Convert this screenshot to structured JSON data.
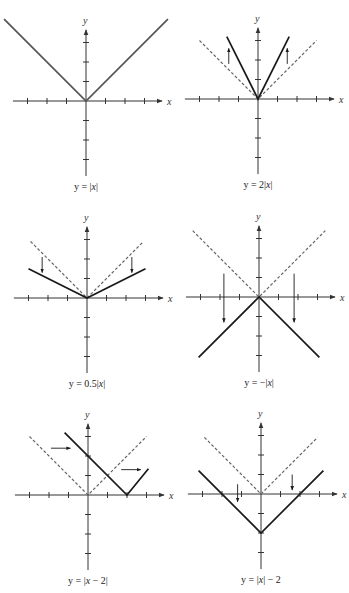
{
  "figure": {
    "colors": {
      "axis": "#333333",
      "solid": "#1a1a1a",
      "base_solid": "#555555",
      "dashed": "#666666",
      "background": "#ffffff"
    },
    "tick_spacing_px": 19.5
  },
  "chart_data": [
    {
      "type": "line",
      "title": "y = |x|",
      "xlabel": "x",
      "ylabel": "y",
      "xlim": [
        -4,
        4
      ],
      "ylim": [
        -4,
        4
      ],
      "ticks": [
        -3,
        -2,
        -1,
        1,
        2,
        3
      ],
      "series": [
        {
          "name": "y = |x|",
          "style": "solid",
          "points": [
            [
              -4.2,
              4.2
            ],
            [
              0,
              0
            ],
            [
              4.2,
              4.2
            ]
          ]
        }
      ],
      "arrows": []
    },
    {
      "type": "line",
      "title": "y = 2|x|",
      "xlabel": "x",
      "ylabel": "y",
      "xlim": [
        -4,
        4
      ],
      "ylim": [
        -4,
        4
      ],
      "ticks": [
        -3,
        -2,
        -1,
        1,
        2,
        3
      ],
      "series": [
        {
          "name": "y = |x|",
          "style": "dashed",
          "points": [
            [
              -3,
              3
            ],
            [
              0,
              0
            ],
            [
              3,
              3
            ]
          ]
        },
        {
          "name": "y = 2|x|",
          "style": "solid",
          "points": [
            [
              -1.6,
              3.2
            ],
            [
              0,
              0
            ],
            [
              1.6,
              3.2
            ]
          ]
        }
      ],
      "arrows": [
        {
          "from": [
            -1.5,
            1.8
          ],
          "to": [
            -1.5,
            2.6
          ],
          "direction": "up"
        },
        {
          "from": [
            1.5,
            1.8
          ],
          "to": [
            1.5,
            2.6
          ],
          "direction": "up"
        }
      ]
    },
    {
      "type": "line",
      "title": "y = 0.5|x|",
      "xlabel": "x",
      "ylabel": "y",
      "xlim": [
        -4,
        4
      ],
      "ylim": [
        -4,
        4
      ],
      "ticks": [
        -3,
        -2,
        -1,
        1,
        2,
        3
      ],
      "series": [
        {
          "name": "y = |x|",
          "style": "dashed",
          "points": [
            [
              -2.9,
              2.9
            ],
            [
              0,
              0
            ],
            [
              2.9,
              2.9
            ]
          ]
        },
        {
          "name": "y = 0.5|x|",
          "style": "solid",
          "points": [
            [
              -3,
              1.5
            ],
            [
              0,
              0
            ],
            [
              3,
              1.5
            ]
          ]
        }
      ],
      "arrows": [
        {
          "from": [
            -2.3,
            2.1
          ],
          "to": [
            -2.3,
            1.3
          ],
          "direction": "down"
        },
        {
          "from": [
            2.3,
            2.1
          ],
          "to": [
            2.3,
            1.3
          ],
          "direction": "down"
        }
      ]
    },
    {
      "type": "line",
      "title": "y = -|x|",
      "xlabel": "x",
      "ylabel": "y",
      "xlim": [
        -4,
        4
      ],
      "ylim": [
        -4,
        4
      ],
      "ticks": [
        -3,
        -2,
        -1,
        1,
        2,
        3
      ],
      "series": [
        {
          "name": "y = |x|",
          "style": "dashed",
          "points": [
            [
              -3.4,
              3.4
            ],
            [
              0,
              0
            ],
            [
              3.4,
              3.4
            ]
          ]
        },
        {
          "name": "y = -|x|",
          "style": "solid",
          "points": [
            [
              -3.1,
              -3.1
            ],
            [
              0,
              0
            ],
            [
              3.1,
              -3.1
            ]
          ]
        }
      ],
      "arrows": [
        {
          "from": [
            -1.8,
            1.2
          ],
          "to": [
            -1.8,
            -1.3
          ],
          "direction": "down"
        },
        {
          "from": [
            1.8,
            1.2
          ],
          "to": [
            1.8,
            -1.3
          ],
          "direction": "down"
        }
      ]
    },
    {
      "type": "line",
      "title": "y = |x - 2|",
      "xlabel": "x",
      "ylabel": "y",
      "xlim": [
        -4,
        4
      ],
      "ylim": [
        -4,
        4
      ],
      "ticks": [
        -3,
        -2,
        -1,
        1,
        2,
        3
      ],
      "series": [
        {
          "name": "y = |x|",
          "style": "dashed",
          "points": [
            [
              -3,
              3
            ],
            [
              0,
              0
            ],
            [
              3,
              3
            ]
          ]
        },
        {
          "name": "y = |x - 2|",
          "style": "solid",
          "points": [
            [
              -1.2,
              3.2
            ],
            [
              2,
              0
            ],
            [
              3.1,
              1.35
            ]
          ]
        }
      ],
      "arrows": [
        {
          "from": [
            -1.9,
            2.4
          ],
          "to": [
            -0.9,
            2.4
          ],
          "direction": "right"
        },
        {
          "from": [
            1.7,
            1.3
          ],
          "to": [
            2.7,
            1.3
          ],
          "direction": "right"
        }
      ]
    },
    {
      "type": "line",
      "title": "y = |x| - 2",
      "xlabel": "x",
      "ylabel": "y",
      "xlim": [
        -4,
        4
      ],
      "ylim": [
        -4,
        4
      ],
      "ticks": [
        -3,
        -2,
        -1,
        1,
        2,
        3
      ],
      "series": [
        {
          "name": "y = |x|",
          "style": "dashed",
          "points": [
            [
              -2.9,
              2.9
            ],
            [
              0,
              0
            ],
            [
              2.9,
              2.9
            ]
          ]
        },
        {
          "name": "y = |x| - 2",
          "style": "solid",
          "points": [
            [
              -3.2,
              1.2
            ],
            [
              0,
              -2
            ],
            [
              3.2,
              1.2
            ]
          ]
        }
      ],
      "arrows": [
        {
          "from": [
            -1.2,
            0.5
          ],
          "to": [
            -1.2,
            -0.4
          ],
          "direction": "down"
        },
        {
          "from": [
            1.6,
            1.0
          ],
          "to": [
            1.6,
            0.2
          ],
          "direction": "down"
        }
      ]
    }
  ],
  "panels": [
    {
      "caption_pre": "y = |",
      "caption_var": "x",
      "caption_post": "|",
      "origin": [
        86,
        101
      ]
    },
    {
      "caption_pre": "y = 2|",
      "caption_var": "x",
      "caption_post": "|",
      "origin": [
        258,
        99
      ]
    },
    {
      "caption_pre": "y = 0.5|",
      "caption_var": "x",
      "caption_post": "|",
      "origin": [
        87,
        298
      ]
    },
    {
      "caption_pre": "y = −|",
      "caption_var": "x",
      "caption_post": "|",
      "origin": [
        259,
        297
      ]
    },
    {
      "caption_pre": "y = |",
      "caption_var": "x",
      "caption_post": " − 2|",
      "origin": [
        88,
        495
      ]
    },
    {
      "caption_pre": "y = |",
      "caption_var": "x",
      "caption_post": "| − 2",
      "origin": [
        261,
        494
      ]
    }
  ],
  "axis_labels": {
    "x": "x",
    "y": "y"
  }
}
